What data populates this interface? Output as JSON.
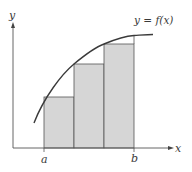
{
  "diagram": {
    "type": "riemann-sum-rectangles",
    "colors": {
      "axis": "#555555",
      "curve": "#3a3a3a",
      "rect_fill": "#d6d6d6",
      "rect_stroke": "#555555",
      "text": "#3a3a3a"
    },
    "labels": {
      "y_axis": "y",
      "x_axis": "x",
      "left_bound": "a",
      "right_bound": "b",
      "curve": "y = f(x)"
    },
    "rectangles": [
      {
        "x0": 44,
        "x1": 74,
        "top": 97
      },
      {
        "x0": 74,
        "x1": 104,
        "top": 64
      },
      {
        "x0": 104,
        "x1": 134,
        "top": 44
      }
    ],
    "rectangle_count": 3
  }
}
